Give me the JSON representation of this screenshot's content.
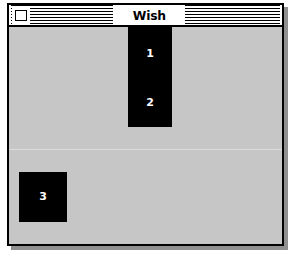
{
  "window": {
    "title": "Wish",
    "close_box_icon": "close-box-icon",
    "background_color": "#c6c6c6",
    "border_color": "#000000",
    "titlebar_color": "#ffffff"
  },
  "canvas": {
    "blocks": [
      {
        "id": "block-top",
        "labels": [
          "1",
          "2"
        ],
        "color": "#000000",
        "text_color": "#ffffff"
      },
      {
        "id": "block-left",
        "labels": [
          "3"
        ],
        "color": "#000000",
        "text_color": "#ffffff"
      }
    ]
  }
}
